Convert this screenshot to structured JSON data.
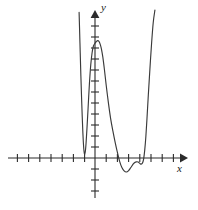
{
  "figure": {
    "kind": "cartesian-graph",
    "width": 198,
    "height": 210,
    "background_color": "#ffffff",
    "axis_color": "#2b2b2b",
    "curve_color": "#3a3a3a"
  },
  "axes": {
    "x_label": "x",
    "y_label": "y",
    "origin_px": {
      "x": 95,
      "y": 158
    },
    "unit_px": 11.2,
    "x_axis": {
      "has_arrow_right": true,
      "has_arrow_left": false,
      "start_px": 8,
      "end_px": 186,
      "tick_values": [
        -7,
        -6,
        -5,
        -4,
        -3,
        -2,
        -1,
        1,
        2,
        3,
        4,
        5,
        6,
        7
      ],
      "tick_half_length_px": 4
    },
    "y_axis": {
      "has_arrow_up": true,
      "has_arrow_down": false,
      "start_px": 198,
      "end_px": 12,
      "tick_values": [
        -4,
        -3,
        -2,
        -1,
        1,
        2,
        3,
        4,
        5,
        6,
        7,
        8,
        9,
        10,
        11,
        12
      ],
      "tick_half_length_px": 4
    }
  },
  "chart_data": {
    "type": "line",
    "title": "",
    "xlabel": "x",
    "ylabel": "y",
    "grid": false,
    "legend": null,
    "xlim": [
      -7.8,
      8.1
    ],
    "ylim": [
      -4.2,
      13.2
    ],
    "series": [
      {
        "name": "polynomial curve",
        "x": [
          -1.42,
          -1.38,
          -1.32,
          -1.26,
          -1.2,
          -1.14,
          -1.08,
          -1.04,
          -1.0,
          -0.96,
          -0.92,
          -0.86,
          -0.8,
          -0.72,
          -0.62,
          -0.5,
          -0.38,
          -0.26,
          -0.14,
          0.0,
          0.12,
          0.24,
          0.36,
          0.48,
          0.58,
          0.7,
          0.84,
          1.0,
          1.2,
          1.4,
          1.6,
          1.8,
          2.0,
          2.2,
          2.4,
          2.6,
          2.8,
          3.0,
          3.2,
          3.4,
          3.55,
          3.7,
          3.85,
          4.0,
          4.12,
          4.24,
          4.34,
          4.44,
          4.54,
          4.64,
          4.76,
          4.9,
          5.05,
          5.2,
          5.35
        ],
        "y": [
          13.0,
          11.6,
          9.4,
          7.3,
          5.4,
          3.7,
          2.2,
          1.4,
          0.8,
          0.45,
          0.35,
          0.6,
          1.3,
          2.6,
          4.4,
          6.6,
          8.3,
          9.4,
          10.0,
          10.25,
          10.4,
          10.48,
          10.4,
          10.1,
          9.7,
          9.0,
          7.9,
          6.5,
          4.9,
          3.5,
          2.4,
          1.4,
          0.5,
          -0.3,
          -0.85,
          -1.15,
          -1.25,
          -1.12,
          -0.85,
          -0.55,
          -0.4,
          -0.34,
          -0.36,
          -0.48,
          -0.55,
          -0.45,
          -0.1,
          0.7,
          1.9,
          3.5,
          5.6,
          7.9,
          10.2,
          12.1,
          13.2
        ]
      }
    ],
    "annotations": [
      {
        "role": "local-maximum",
        "x": 0.25,
        "y": 10.5
      },
      {
        "role": "local-minimum",
        "x": 2.85,
        "y": -1.25
      },
      {
        "role": "local-minimum",
        "x": -0.92,
        "y": 0.35
      },
      {
        "role": "shelf-inflection",
        "x": 3.72,
        "y": -0.34
      }
    ]
  }
}
